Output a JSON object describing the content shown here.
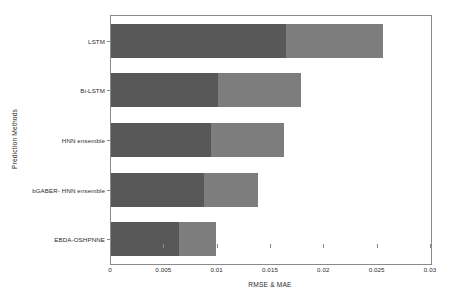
{
  "chart_data": {
    "type": "bar",
    "orientation": "horizontal",
    "stacked": true,
    "title": "",
    "xlabel": "RMSE & MAE",
    "ylabel": "Prediction Methods",
    "categories": [
      "LSTM",
      "Bi-LSTM",
      "HNN ensemble",
      "bGABER- HNN ensemble",
      "EBDA-OSHPNNE"
    ],
    "series": [
      {
        "name": "RMSE",
        "color": "#585858",
        "values": [
          0.0164,
          0.01,
          0.0094,
          0.0087,
          0.0064
        ]
      },
      {
        "name": "MAE",
        "color": "#7d7d7d",
        "values": [
          0.0091,
          0.0078,
          0.0068,
          0.0051,
          0.0034
        ]
      }
    ],
    "totals": [
      0.0255,
      0.0178,
      0.0162,
      0.0138,
      0.0098
    ],
    "xlim": [
      0,
      0.03
    ],
    "xticks": [
      0,
      0.005,
      0.01,
      0.015,
      0.02,
      0.025,
      0.03
    ],
    "xtick_labels": [
      "0",
      "0.005",
      "0.01",
      "0.015",
      "0.02",
      "0.025",
      "0.03"
    ],
    "grid": false,
    "legend": "none"
  },
  "axis": {
    "x_title": "RMSE & MAE",
    "y_title": "Prediction Methods"
  }
}
